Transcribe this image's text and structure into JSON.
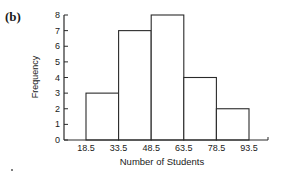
{
  "panel_label": "(b)",
  "chart_data": {
    "type": "bar",
    "subtype": "histogram",
    "title": "",
    "xlabel": "Number of Students",
    "ylabel": "Frequency",
    "bin_edges": [
      18.5,
      33.5,
      48.5,
      63.5,
      78.5,
      93.5
    ],
    "categories": [
      "18.5-33.5",
      "33.5-48.5",
      "48.5-63.5",
      "63.5-78.5",
      "78.5-93.5"
    ],
    "values": [
      3,
      7,
      8,
      4,
      2
    ],
    "xtick_labels": [
      "18.5",
      "33.5",
      "48.5",
      "63.5",
      "78.5",
      "93.5"
    ],
    "yticks": [
      0,
      1,
      2,
      3,
      4,
      5,
      6,
      7,
      8
    ],
    "ylim": [
      0,
      8
    ],
    "grid": false,
    "legend": null
  },
  "colors": {
    "line": "#2a2a2a",
    "bar_fill": "#ffffff",
    "text": "#1a1a1a"
  }
}
